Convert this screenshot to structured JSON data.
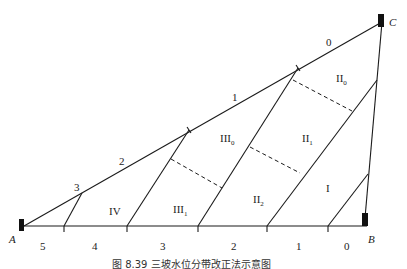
{
  "figure": {
    "caption": "图 8.39  三坡水位分带改正法示意图",
    "points": {
      "A": "A",
      "B": "B",
      "C": "C"
    },
    "edge_AC_labels": [
      "0",
      "1",
      "2",
      "3"
    ],
    "baseline_labels": [
      "5",
      "4",
      "3",
      "2",
      "1",
      "0"
    ],
    "zones": [
      {
        "id": "IV",
        "main": "IV",
        "sub": ""
      },
      {
        "id": "III1",
        "main": "III",
        "sub": "1"
      },
      {
        "id": "III0",
        "main": "III",
        "sub": "0"
      },
      {
        "id": "II2",
        "main": "II",
        "sub": "2"
      },
      {
        "id": "II1",
        "main": "II",
        "sub": "1"
      },
      {
        "id": "II0",
        "main": "II",
        "sub": "0"
      },
      {
        "id": "I",
        "main": "I",
        "sub": ""
      }
    ],
    "colors": {
      "line": "#1a1a1a",
      "marker": "#111111",
      "background": "#ffffff"
    }
  }
}
